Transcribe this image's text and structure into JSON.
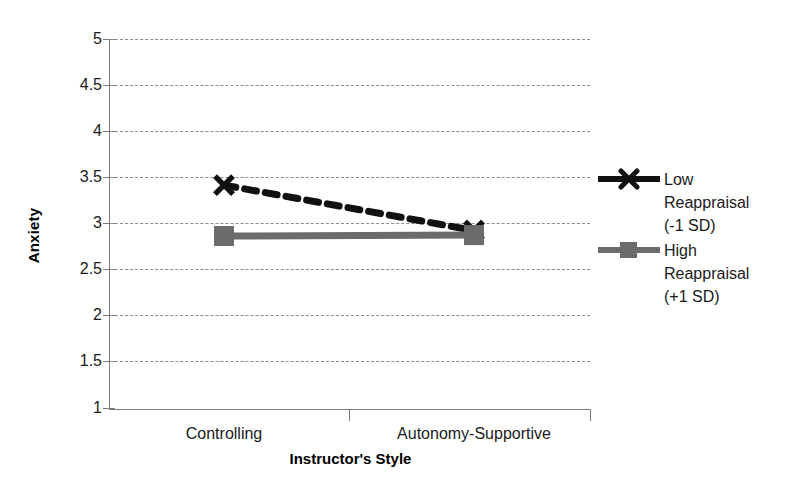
{
  "chart_data": {
    "type": "line",
    "title": "",
    "xlabel": "Instructor's Style",
    "ylabel": "Anxiety",
    "categories": [
      "Controlling",
      "Autonomy-Supportive"
    ],
    "ylim": [
      1,
      5
    ],
    "yticks": [
      "1",
      "1.5",
      "2",
      "2.5",
      "3",
      "3.5",
      "4",
      "4.5",
      "5"
    ],
    "ytick_values": [
      1,
      1.5,
      2,
      2.5,
      3,
      3.5,
      4,
      4.5,
      5
    ],
    "grid": true,
    "legend_position": "right",
    "series": [
      {
        "name": "Low Reappraisal (-1 SD)",
        "label_lines": "Low\nReappraisal\n(-1 SD)",
        "values": [
          3.42,
          2.93
        ],
        "color": "#111111",
        "linestyle": "dashed",
        "marker": "x"
      },
      {
        "name": "High Reappraisal (+1 SD)",
        "label_lines": "High\nReappraisal\n(+1 SD)",
        "values": [
          2.87,
          2.88
        ],
        "color": "#6b6b6b",
        "linestyle": "solid",
        "marker": "square"
      }
    ]
  },
  "axis": {
    "y_title": "Anxiety",
    "x_title": "Instructor's Style",
    "ytick_1": "1",
    "ytick_2": "1.5",
    "ytick_3": "2",
    "ytick_4": "2.5",
    "ytick_5": "3",
    "ytick_6": "3.5",
    "ytick_7": "4",
    "ytick_8": "4.5",
    "ytick_9": "5",
    "xtick_1": "Controlling",
    "xtick_2": "Autonomy-Supportive"
  },
  "legend": {
    "entry_1": "Low\nReappraisal\n(-1 SD)",
    "entry_2": "High\nReappraisal\n(+1 SD)"
  },
  "colors": {
    "series_low": "#111111",
    "series_high": "#6b6b6b",
    "grid": "#8c8c8c",
    "axis": "#7a7a7a",
    "background": "#ffffff"
  }
}
